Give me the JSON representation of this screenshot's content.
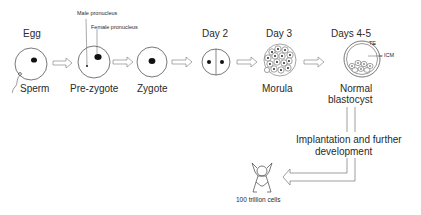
{
  "diagram": {
    "type": "embryo-development-timeline",
    "stages": [
      {
        "id": "egg",
        "top_label": "Egg",
        "bottom_label": "Sperm"
      },
      {
        "id": "pre-zygote",
        "top_label": "",
        "bottom_label": "Pre-zygote",
        "annotations": [
          "Male pronucleus",
          "Female pronucleus"
        ]
      },
      {
        "id": "zygote",
        "top_label": "",
        "bottom_label": "Zygote"
      },
      {
        "id": "day2",
        "top_label": "Day 2",
        "bottom_label": ""
      },
      {
        "id": "morula",
        "top_label": "Day 3",
        "bottom_label": "Morula"
      },
      {
        "id": "blastocyst",
        "top_label": "Days 4-5",
        "bottom_label_line1": "Normal",
        "bottom_label_line2": "blastocyst",
        "annotations": [
          "TE",
          "ICM"
        ]
      }
    ],
    "process_label_line1": "Implantation and further",
    "process_label_line2": "development",
    "result_label": "100 trillion cells",
    "colors": {
      "line": "#555555",
      "nucleus": "#111111",
      "text": "#2a2a2a"
    }
  }
}
